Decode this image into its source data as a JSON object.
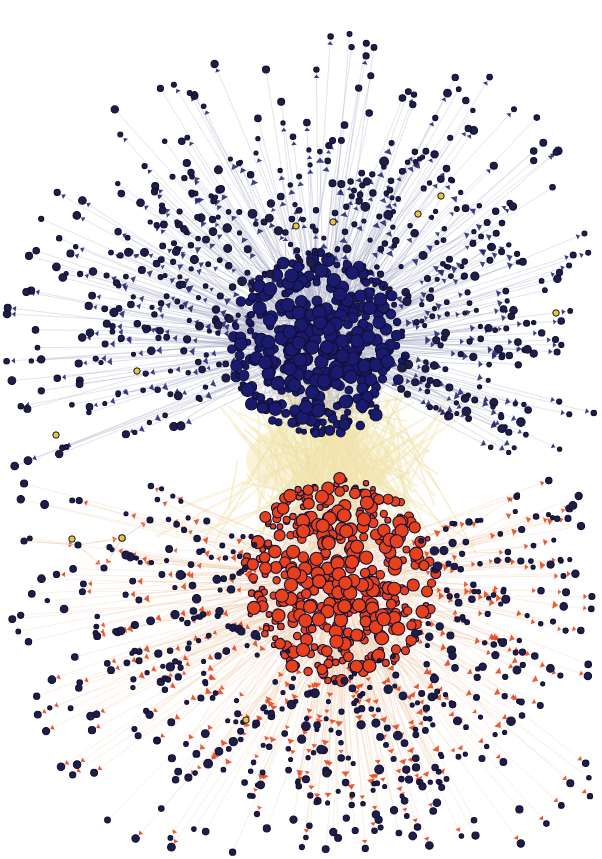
{
  "figure": {
    "kind": "network-graph",
    "background_color": "#ffffff",
    "width": 602,
    "height": 859,
    "title": "",
    "has_axes": false,
    "has_legend": false,
    "has_text_labels": false
  },
  "chart_data": {
    "type": "scatter",
    "title": "",
    "subtitle": "",
    "xlabel": "",
    "ylabel": "",
    "grid": false,
    "legend_position": "none",
    "xlim": [
      0,
      602
    ],
    "ylim": [
      0,
      859
    ],
    "graph_type": "directed force-directed network",
    "layout": "force-directed / spring embedding",
    "node_count_estimate": 1450,
    "edge_count_estimate": 2600,
    "node_size_encoding": "degree",
    "node_size_range_px": [
      3,
      13
    ],
    "node_stroke_color": "#101038",
    "node_stroke_width_px": 1.1,
    "edge_arrowheads": true,
    "communities": [
      {
        "name": "blue-community",
        "color": "#1a1a6e",
        "edge_color": "#a8aac4",
        "arrow_color": "#262673",
        "center_x": 318,
        "center_y": 345,
        "core_radius": 88,
        "halo_radius": 215,
        "core_nodes": 430,
        "halo_nodes": 300,
        "position": "upper"
      },
      {
        "name": "orange-community",
        "color": "#e8401a",
        "edge_color": "#f0cdb0",
        "arrow_color": "#e8441c",
        "center_x": 340,
        "center_y": 580,
        "core_radius": 96,
        "halo_radius": 225,
        "core_nodes": 420,
        "halo_nodes": 300,
        "position": "lower"
      }
    ],
    "bridge": {
      "name": "inter-community-bridge",
      "edge_color": "#ece0a0",
      "x": 320,
      "y": 460,
      "description": "pale yellow edge bundle linking the blue and orange cores"
    },
    "accent_nodes": {
      "name": "yellow-accent-node",
      "color": "#e8c838",
      "count": 9
    },
    "satellite_component": {
      "name": "isolated-satellite-component",
      "node_count": 5,
      "center_x": 62,
      "center_y": 545,
      "edge_color": "#f0cdb0"
    },
    "colors": {
      "blue_node": "#1a1a6e",
      "orange_node": "#e8401a",
      "blue_edge": "#a8aac4",
      "orange_edge": "#f0cdb0",
      "bridge_edge": "#ece0a0",
      "accent_node": "#e8c838",
      "leaf_node": "#1e1e46",
      "background": "#ffffff"
    }
  }
}
